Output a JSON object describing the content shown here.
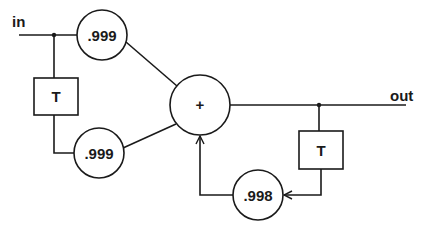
{
  "diagram": {
    "title": "",
    "colors": {
      "stroke": "#1a1a1a",
      "background": "#ffffff"
    },
    "terminals": {
      "input": "in",
      "output": "out"
    },
    "nodes": {
      "gain_top": ".999",
      "gain_bottom": ".999",
      "delay_input": "T",
      "sum": "+",
      "delay_feedback": "T",
      "gain_feedback": ".998"
    }
  }
}
